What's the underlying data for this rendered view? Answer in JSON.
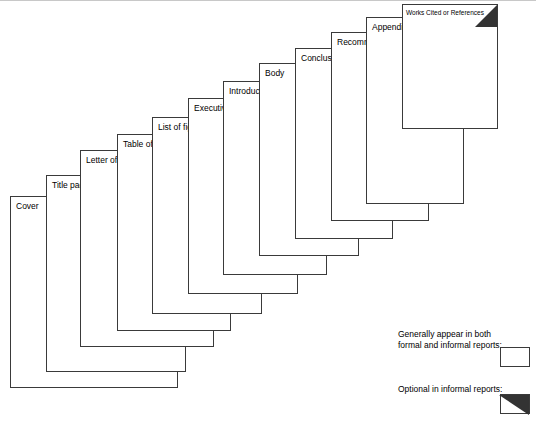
{
  "diagram": {
    "pages": [
      {
        "label": "Cover",
        "optional": false
      },
      {
        "label": "Title page",
        "optional": true
      },
      {
        "label": "Letter of transmittal",
        "optional": true
      },
      {
        "label": "Table of contents",
        "optional": true
      },
      {
        "label": "List of figures",
        "optional": true
      },
      {
        "label": "Executive summary",
        "optional": true
      },
      {
        "label": "Introduction",
        "optional": false
      },
      {
        "label": "Body",
        "optional": false
      },
      {
        "label": "Conclusions",
        "optional": false
      },
      {
        "label": "Recommendations",
        "optional": false
      },
      {
        "label": "Appendix",
        "optional": false
      },
      {
        "label": "Works Cited or References",
        "optional": true
      }
    ]
  },
  "legend": {
    "items": [
      {
        "text": "Generally appear in both\nformal and informal reports:",
        "optional": false
      },
      {
        "text": "Optional in informal reports:",
        "optional": true
      }
    ]
  },
  "colors": {
    "page_fill": "#ffffff",
    "page_stroke": "#3a3a3a",
    "corner_fill": "#333333",
    "text": "#000000"
  }
}
